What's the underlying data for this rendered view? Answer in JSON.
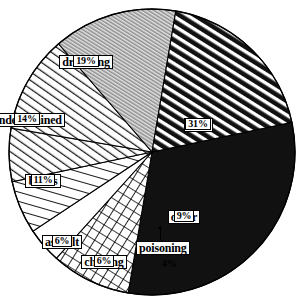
{
  "chart_data": {
    "type": "pie",
    "title": "",
    "subtitle": "",
    "xlabel": "",
    "ylabel": "",
    "legend_position": "in-slice-labels",
    "grid": false,
    "units": "percent",
    "total": 100,
    "start_angle_deg": -12,
    "direction": "clockwise",
    "categories": [
      "road",
      "other",
      "poisoning",
      "choking",
      "assault",
      "burns",
      "undetermined",
      "drowning"
    ],
    "values": [
      31,
      9,
      4,
      6,
      6,
      11,
      14,
      19
    ],
    "slices": [
      {
        "label": "road",
        "value": 31,
        "pct_text": "31%",
        "fill": "solid-black",
        "color": "#111111"
      },
      {
        "label": "other",
        "value": 9,
        "pct_text": "9%",
        "fill": "crosshatch",
        "color": "#000000"
      },
      {
        "label": "poisoning",
        "value": 4,
        "pct_text": "4%",
        "fill": "blank-white",
        "color": "#ffffff"
      },
      {
        "label": "choking",
        "value": 6,
        "pct_text": "6%",
        "fill": "fine-diagonal",
        "color": "#000000"
      },
      {
        "label": "assault",
        "value": 6,
        "pct_text": "6%",
        "fill": "diagonal-lines",
        "color": "#000000"
      },
      {
        "label": "burns",
        "value": 11,
        "pct_text": "11%",
        "fill": "diagonal-lines",
        "color": "#000000"
      },
      {
        "label": "undetermined",
        "value": 14,
        "pct_text": "14%",
        "fill": "gray-fine-stripes",
        "color": "#9a9a9a"
      },
      {
        "label": "drowning",
        "value": 19,
        "pct_text": "19%",
        "fill": "bold-diagonal",
        "color": "#000000"
      }
    ]
  },
  "labels": {
    "road": {
      "name": "road",
      "pct": "31%"
    },
    "other": {
      "name": "other",
      "pct": "9%"
    },
    "poisoning": {
      "name": "poisoning",
      "pct": "4%"
    },
    "choking": {
      "name": "choking",
      "pct": "6%"
    },
    "assault": {
      "name": "assault",
      "pct": "6%"
    },
    "burns": {
      "name": "burns",
      "pct": "11%"
    },
    "undetermined": {
      "name": "undetermined",
      "pct": "14%"
    },
    "drowning": {
      "name": "drowning",
      "pct": "19%"
    }
  },
  "geometry": {
    "cx": 152,
    "cy": 152,
    "r": 143
  }
}
